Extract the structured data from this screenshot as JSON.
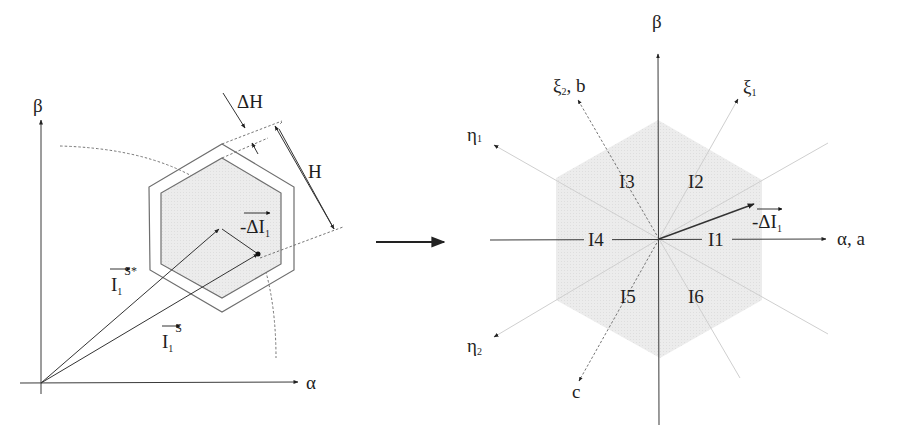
{
  "left_diagram": {
    "axes": {
      "x_label": "α",
      "y_label": "β"
    },
    "hysteresis_band": {
      "delta_label": "ΔH",
      "width_label": "H"
    },
    "vectors": {
      "reference": {
        "main": "I",
        "sub": "1",
        "sup": "S*"
      },
      "actual": {
        "main": "I",
        "sub": "1",
        "sup": "S"
      },
      "error": {
        "prefix": "-ΔI",
        "sub": "1"
      }
    }
  },
  "transition_arrow": "→",
  "right_diagram": {
    "axes": {
      "x_label": "α, a",
      "y_label": "β"
    },
    "phase_axes": {
      "b": {
        "main": "ξ",
        "sub": "2",
        "suffix": ", b"
      },
      "xi1": {
        "main": "ξ",
        "sub": "1"
      },
      "eta1": {
        "main": "η",
        "sub": "1"
      },
      "eta2": {
        "main": "η",
        "sub": "2"
      },
      "c": "c"
    },
    "sectors": [
      "I1",
      "I2",
      "I3",
      "I4",
      "I5",
      "I6"
    ],
    "error_vector": {
      "prefix": "-ΔI",
      "sub": "1"
    }
  },
  "colors": {
    "hex_fill": "#e9e9e9",
    "line": "#3a3a3a",
    "faint_line": "#cfcfcf"
  }
}
